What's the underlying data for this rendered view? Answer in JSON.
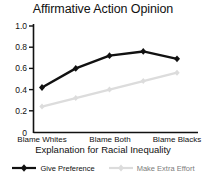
{
  "chart_data": {
    "type": "line",
    "title": "Affirmative Action Opinion",
    "xlabel": "Explanation for Racial Inequality",
    "ylabel": "",
    "x": [
      1,
      2,
      3,
      4,
      5
    ],
    "categories": [
      "Blame Whites",
      "",
      "Blame Both",
      "",
      "Blame Blacks"
    ],
    "xtick_labels": [
      "Blame Whites",
      "Blame Both",
      "Blame Blacks"
    ],
    "ytick_labels": [
      "0",
      "0.2",
      "0.4",
      "0.6",
      "0.8",
      "1.0"
    ],
    "ytick_values": [
      0,
      0.2,
      0.4,
      0.6,
      0.8,
      1.0
    ],
    "ylim": [
      0,
      1.0
    ],
    "grid": false,
    "legend_position": "bottom",
    "series": [
      {
        "name": "Give Preference",
        "color": "#111111",
        "marker": "diamond",
        "values": [
          0.42,
          0.6,
          0.72,
          0.76,
          0.69
        ]
      },
      {
        "name": "Make Extra Effort",
        "color": "#dcdcdc",
        "marker": "diamond",
        "values": [
          0.24,
          0.32,
          0.4,
          0.48,
          0.56
        ]
      }
    ]
  },
  "legend": {
    "entries": [
      {
        "label": "Give Preference"
      },
      {
        "label": "Make Extra Effort"
      }
    ]
  },
  "axis": {
    "y_labels": [
      "1.0",
      "0.8",
      "0.6",
      "0.4",
      "0.2",
      "0"
    ],
    "x_labels": [
      "Blame Whites",
      "Blame Both",
      "Blame Blacks"
    ]
  },
  "colors": {
    "series_primary": "#111111",
    "series_secondary": "#dcdcdc",
    "axis": "#111111",
    "background": "#ffffff"
  }
}
